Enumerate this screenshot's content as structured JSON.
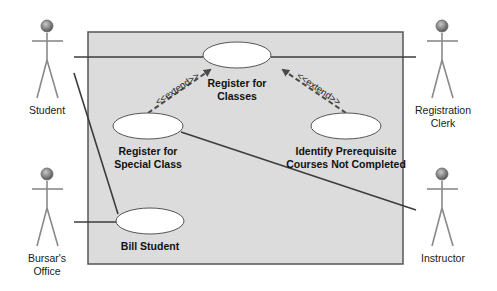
{
  "diagram": {
    "type": "UML use case diagram",
    "system_boundary": {
      "fill": "#dcdcdc",
      "stroke": "#555555"
    },
    "actors": [
      {
        "id": "student",
        "label": "Student"
      },
      {
        "id": "registration_clerk",
        "label_line1": "Registration",
        "label_line2": "Clerk"
      },
      {
        "id": "bursars_office",
        "label_line1": "Bursar's",
        "label_line2": "Office"
      },
      {
        "id": "instructor",
        "label": "Instructor"
      }
    ],
    "use_cases": [
      {
        "id": "register_for_classes",
        "label_line1": "Register for",
        "label_line2": "Classes"
      },
      {
        "id": "register_for_special_class",
        "label_line1": "Register for",
        "label_line2": "Special Class"
      },
      {
        "id": "identify_prerequisite",
        "label_line1": "Identify Prerequisite",
        "label_line2": "Courses Not Completed"
      },
      {
        "id": "bill_student",
        "label": "Bill Student"
      }
    ],
    "relationships": [
      {
        "from": "student",
        "to": "register_for_classes",
        "type": "association"
      },
      {
        "from": "registration_clerk",
        "to": "register_for_classes",
        "type": "association"
      },
      {
        "from": "student",
        "to": "bill_student",
        "type": "association"
      },
      {
        "from": "bursars_office",
        "to": "bill_student",
        "type": "association"
      },
      {
        "from": "register_for_special_class",
        "to": "instructor",
        "type": "association"
      },
      {
        "from": "register_for_special_class",
        "to": "register_for_classes",
        "type": "extend",
        "label": "<<extend>>"
      },
      {
        "from": "identify_prerequisite",
        "to": "register_for_classes",
        "type": "extend",
        "label": "<<extend>>"
      }
    ],
    "colors": {
      "association_line": "#3c3c3c",
      "extend_arrow": "#4a4a4a",
      "actor_body": "#8a8a8a",
      "actor_head": "#777777",
      "ellipse_fill": "#ffffff"
    }
  }
}
